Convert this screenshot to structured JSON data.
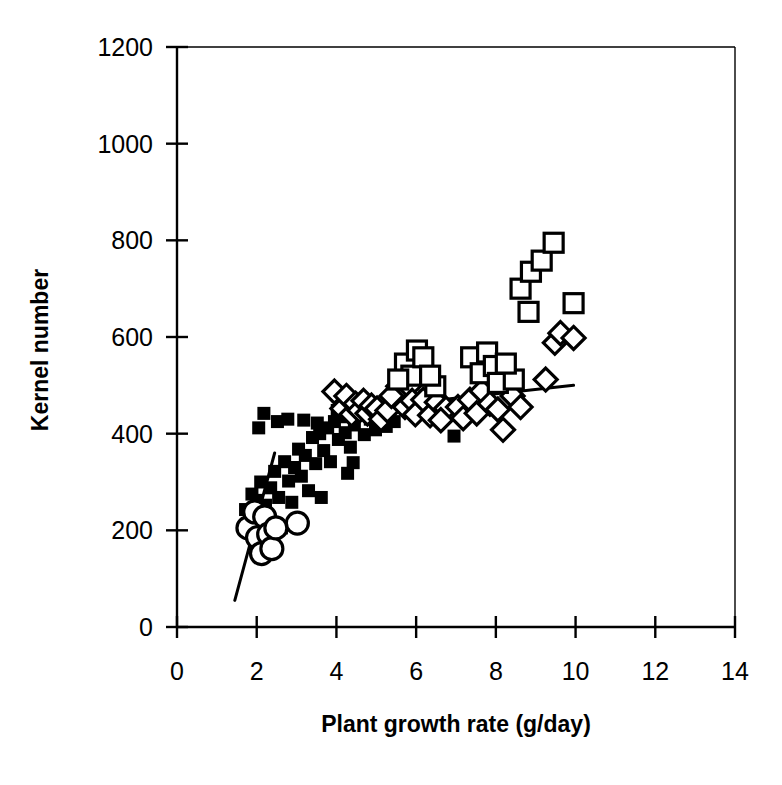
{
  "chart_data": {
    "type": "scatter",
    "title": "",
    "xlabel": "Plant growth rate (g/day)",
    "ylabel": "Kernel number",
    "xlim": [
      0,
      14
    ],
    "ylim": [
      0,
      1200
    ],
    "xticks": [
      0,
      2,
      4,
      6,
      8,
      10,
      12,
      14
    ],
    "yticks": [
      0,
      200,
      400,
      600,
      800,
      1000,
      1200
    ],
    "xtick_labels": [
      "0",
      "2",
      "4",
      "6",
      "8",
      "10",
      "12",
      "14"
    ],
    "ytick_labels": [
      "0",
      "200",
      "400",
      "600",
      "800",
      "1000",
      "1200"
    ],
    "grid": false,
    "legend": "none",
    "frame": "box",
    "series": [
      {
        "name": "open-circle",
        "marker": "open-circle",
        "color": "#000000",
        "points": [
          [
            1.78,
            205
          ],
          [
            1.95,
            238
          ],
          [
            2.02,
            185
          ],
          [
            2.12,
            152
          ],
          [
            2.2,
            228
          ],
          [
            2.3,
            192
          ],
          [
            2.38,
            162
          ],
          [
            2.48,
            205
          ],
          [
            3.02,
            215
          ]
        ]
      },
      {
        "name": "filled-square",
        "marker": "filled-square",
        "color": "#000000",
        "points": [
          [
            1.72,
            243
          ],
          [
            1.88,
            275
          ],
          [
            2.0,
            262
          ],
          [
            2.1,
            300
          ],
          [
            2.22,
            252
          ],
          [
            2.35,
            288
          ],
          [
            2.45,
            322
          ],
          [
            2.55,
            268
          ],
          [
            2.62,
            205
          ],
          [
            2.7,
            342
          ],
          [
            2.8,
            302
          ],
          [
            2.88,
            258
          ],
          [
            2.95,
            330
          ],
          [
            3.05,
            368
          ],
          [
            3.12,
            312
          ],
          [
            3.22,
            355
          ],
          [
            3.3,
            282
          ],
          [
            3.4,
            392
          ],
          [
            3.48,
            338
          ],
          [
            3.58,
            400
          ],
          [
            3.68,
            365
          ],
          [
            3.78,
            412
          ],
          [
            3.85,
            342
          ],
          [
            3.95,
            425
          ],
          [
            4.05,
            388
          ],
          [
            4.12,
            435
          ],
          [
            4.22,
            402
          ],
          [
            4.35,
            372
          ],
          [
            4.45,
            418
          ],
          [
            4.58,
            445
          ],
          [
            4.7,
            398
          ],
          [
            4.85,
            430
          ],
          [
            4.98,
            408
          ],
          [
            5.1,
            440
          ],
          [
            5.25,
            415
          ],
          [
            5.45,
            425
          ],
          [
            2.05,
            412
          ],
          [
            2.18,
            442
          ],
          [
            2.52,
            425
          ],
          [
            2.78,
            430
          ],
          [
            3.18,
            428
          ],
          [
            3.52,
            422
          ],
          [
            4.02,
            448
          ],
          [
            4.42,
            340
          ],
          [
            5.62,
            468
          ],
          [
            6.05,
            452
          ],
          [
            6.22,
            478
          ],
          [
            6.95,
            395
          ],
          [
            3.62,
            268
          ],
          [
            4.28,
            318
          ]
        ]
      },
      {
        "name": "open-diamond",
        "marker": "open-diamond",
        "color": "#000000",
        "points": [
          [
            3.95,
            487
          ],
          [
            4.15,
            452
          ],
          [
            4.25,
            478
          ],
          [
            4.38,
            440
          ],
          [
            4.48,
            462
          ],
          [
            4.58,
            448
          ],
          [
            4.68,
            468
          ],
          [
            4.78,
            442
          ],
          [
            4.88,
            458
          ],
          [
            5.02,
            452
          ],
          [
            5.12,
            430
          ],
          [
            5.28,
            448
          ],
          [
            5.55,
            498
          ],
          [
            5.62,
            470
          ],
          [
            5.72,
            455
          ],
          [
            5.82,
            498
          ],
          [
            5.9,
            468
          ],
          [
            5.98,
            440
          ],
          [
            6.18,
            470
          ],
          [
            6.35,
            438
          ],
          [
            6.52,
            465
          ],
          [
            6.75,
            452
          ],
          [
            7.05,
            455
          ],
          [
            7.18,
            432
          ],
          [
            7.35,
            470
          ],
          [
            7.52,
            442
          ],
          [
            7.65,
            488
          ],
          [
            7.85,
            462
          ],
          [
            8.05,
            450
          ],
          [
            8.18,
            408
          ],
          [
            8.42,
            478
          ],
          [
            8.62,
            455
          ],
          [
            9.25,
            512
          ],
          [
            9.48,
            588
          ],
          [
            9.62,
            608
          ],
          [
            9.95,
            598
          ],
          [
            5.38,
            478
          ],
          [
            6.62,
            428
          ]
        ]
      },
      {
        "name": "open-square",
        "marker": "open-square",
        "color": "#000000",
        "points": [
          [
            5.72,
            545
          ],
          [
            5.88,
            520
          ],
          [
            6.02,
            572
          ],
          [
            6.18,
            558
          ],
          [
            6.48,
            498
          ],
          [
            7.38,
            558
          ],
          [
            7.62,
            525
          ],
          [
            7.78,
            568
          ],
          [
            7.95,
            540
          ],
          [
            8.05,
            505
          ],
          [
            8.45,
            512
          ],
          [
            8.62,
            700
          ],
          [
            8.82,
            652
          ],
          [
            8.88,
            735
          ],
          [
            9.15,
            758
          ],
          [
            9.45,
            795
          ],
          [
            9.95,
            670
          ],
          [
            5.55,
            512
          ],
          [
            6.35,
            520
          ],
          [
            8.25,
            545
          ]
        ]
      }
    ],
    "regression_lines": [
      {
        "name": "lower-left-fit",
        "x": [
          1.45,
          2.45
        ],
        "y": [
          55,
          360
        ]
      },
      {
        "name": "upper-right-fit",
        "x": [
          6.62,
          9.95
        ],
        "y": [
          470,
          500
        ]
      }
    ]
  },
  "axes": {
    "x_title": "Plant growth rate (g/day)",
    "y_title": "Kernel number"
  }
}
